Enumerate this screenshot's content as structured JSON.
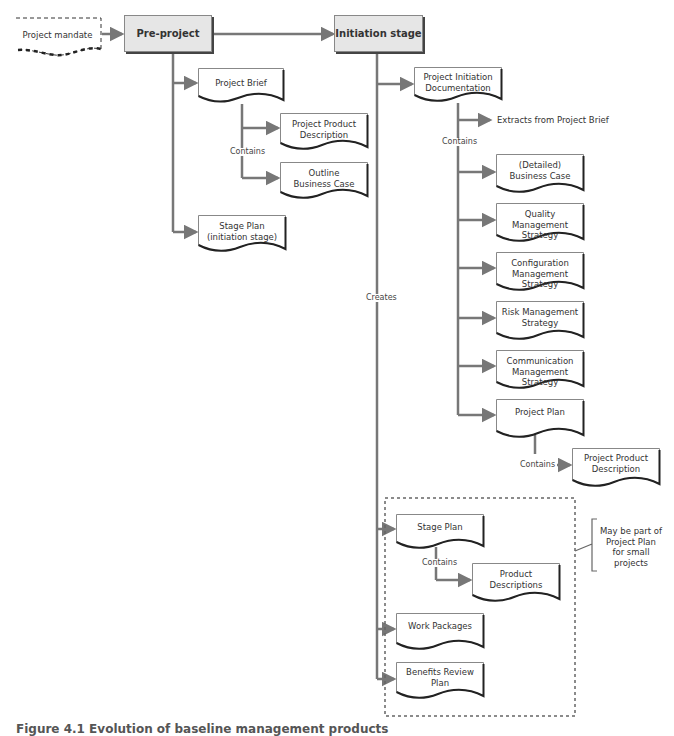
{
  "stages": {
    "mandate": "Project mandate",
    "pre_project": "Pre-project",
    "initiation": "Initiation stage"
  },
  "pre_project_products": {
    "project_brief": "Project Brief",
    "contains_label": "Contains",
    "project_product_description": "Project Product\nDescription",
    "outline_business_case": "Outline\nBusiness Case",
    "stage_plan_initiation": "Stage Plan\n(initiation stage)"
  },
  "initiation_products": {
    "pid": "Project Initiation\nDocumentation",
    "extracts_label": "Extracts from Project Brief",
    "contains_label": "Contains",
    "detailed_business_case": "(Detailed)\nBusiness Case",
    "quality_strategy": "Quality\nManagement Strategy",
    "configuration_strategy": "Configuration\nManagement Strategy",
    "risk_strategy": "Risk Management\nStrategy",
    "communication_strategy": "Communication\nManagement Strategy",
    "project_plan": "Project Plan",
    "plan_contains_label": "Contains",
    "plan_project_product_description": "Project Product\nDescription",
    "creates_label": "Creates"
  },
  "stage_group": {
    "stage_plan": "Stage Plan",
    "contains_label": "Contains",
    "product_descriptions": "Product\nDescriptions",
    "work_packages": "Work Packages",
    "benefits_review_plan": "Benefits Review\nPlan",
    "annotation": "May be part of\nProject Plan\nfor small\nprojects"
  },
  "caption": "Figure 4.1  Evolution of baseline management products",
  "colors": {
    "connector": "#777777",
    "stage_fill": "#e6e6e6",
    "shadow": "#333333",
    "text": "#333333"
  }
}
